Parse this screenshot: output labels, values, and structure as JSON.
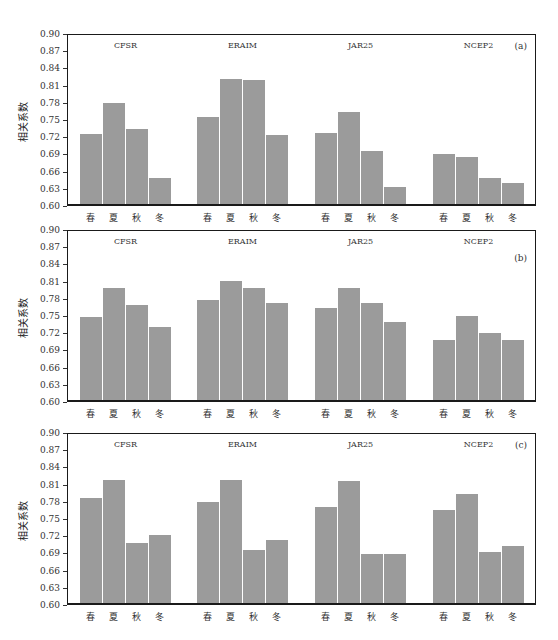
{
  "chart_data": [
    {
      "type": "bar",
      "panel_label": "(a)",
      "ylabel": "相关系数",
      "ylim": [
        0.6,
        0.9
      ],
      "yticks": [
        "0.90",
        "0.87",
        "0.84",
        "0.81",
        "0.78",
        "0.75",
        "0.72",
        "0.69",
        "0.66",
        "0.63",
        "0.60"
      ],
      "groups": [
        "CFSR",
        "ERAIM",
        "JAR25",
        "NCEP2"
      ],
      "categories": [
        "春",
        "夏",
        "秋",
        "冬"
      ],
      "series": [
        {
          "name": "CFSR",
          "values": [
            0.724,
            0.78,
            0.734,
            0.647
          ]
        },
        {
          "name": "ERAIM",
          "values": [
            0.755,
            0.822,
            0.82,
            0.722
          ]
        },
        {
          "name": "JAR25",
          "values": [
            0.726,
            0.763,
            0.694,
            0.63
          ]
        },
        {
          "name": "NCEP2",
          "values": [
            0.689,
            0.684,
            0.647,
            0.637
          ]
        }
      ]
    },
    {
      "type": "bar",
      "panel_label": "(b)",
      "ylabel": "相关系数",
      "ylim": [
        0.6,
        0.9
      ],
      "yticks": [
        "0.90",
        "0.87",
        "0.84",
        "0.81",
        "0.78",
        "0.75",
        "0.72",
        "0.69",
        "0.66",
        "0.63",
        "0.60"
      ],
      "groups": [
        "CFSR",
        "ERAIM",
        "JAR25",
        "NCEP2"
      ],
      "categories": [
        "春",
        "夏",
        "秋",
        "冬"
      ],
      "series": [
        {
          "name": "CFSR",
          "values": [
            0.747,
            0.799,
            0.768,
            0.729
          ]
        },
        {
          "name": "ERAIM",
          "values": [
            0.778,
            0.811,
            0.799,
            0.773
          ]
        },
        {
          "name": "JAR25",
          "values": [
            0.764,
            0.799,
            0.773,
            0.738
          ]
        },
        {
          "name": "NCEP2",
          "values": [
            0.706,
            0.75,
            0.719,
            0.706
          ]
        }
      ]
    },
    {
      "type": "bar",
      "panel_label": "(c)",
      "ylabel": "相关系数",
      "ylim": [
        0.6,
        0.9
      ],
      "yticks": [
        "0.90",
        "0.87",
        "0.84",
        "0.81",
        "0.78",
        "0.75",
        "0.72",
        "0.69",
        "0.66",
        "0.63",
        "0.60"
      ],
      "groups": [
        "CFSR",
        "ERAIM",
        "JAR25",
        "NCEP2"
      ],
      "categories": [
        "春",
        "夏",
        "秋",
        "冬"
      ],
      "series": [
        {
          "name": "CFSR",
          "values": [
            0.787,
            0.818,
            0.706,
            0.72
          ]
        },
        {
          "name": "ERAIM",
          "values": [
            0.78,
            0.818,
            0.694,
            0.712
          ]
        },
        {
          "name": "JAR25",
          "values": [
            0.771,
            0.816,
            0.687,
            0.687
          ]
        },
        {
          "name": "NCEP2",
          "values": [
            0.766,
            0.794,
            0.691,
            0.701
          ]
        }
      ]
    }
  ],
  "colors": {
    "bar": "#9b9b9b",
    "axis": "#1a1a1a"
  },
  "layout": {
    "panel_tops": [
      34,
      230,
      433
    ],
    "plot_height": 172
  }
}
